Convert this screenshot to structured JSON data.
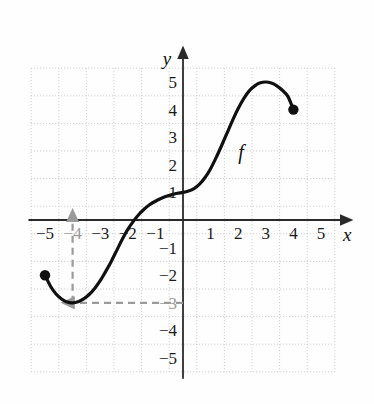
{
  "figure": {
    "background_color": "#fefefe",
    "curve_label": "f",
    "axis_labels": {
      "x": "x",
      "y": "y"
    }
  },
  "colors": {
    "curve": "#101010",
    "axis": "#2a2a2a",
    "grid": "#c9c9c9",
    "tick_text": "#1a1a1a",
    "tick_text_dim": "#9a9a9a",
    "guide": "#9a9a9a",
    "endpoint_dot": "#101010"
  },
  "chart_data": {
    "type": "line",
    "title": "",
    "subtitle": "",
    "xlabel": "x",
    "ylabel": "y",
    "xlim": [
      -5.5,
      5.5
    ],
    "ylim": [
      -5.5,
      5.5
    ],
    "grid": true,
    "grid_style": "dotted",
    "grid_spacing": 1,
    "legend": "none",
    "legend_position": "none",
    "annotations": [
      {
        "name": "curve-label",
        "text": "f",
        "x": 2.1,
        "y": 2.2,
        "style": "italic"
      },
      {
        "name": "vertical-guide-arrow",
        "type": "dashed-arrow",
        "from": [
          -4,
          -3
        ],
        "to": [
          -4,
          0
        ],
        "direction": "up",
        "color": "#9a9a9a"
      },
      {
        "name": "horizontal-guide-arrow",
        "type": "dashed-arrow",
        "from": [
          0,
          -3
        ],
        "to": [
          -4,
          -3
        ],
        "direction": "left",
        "color": "#9a9a9a"
      }
    ],
    "endpoints": [
      {
        "name": "left-endpoint",
        "x": -5,
        "y": -2,
        "marker": "filled-circle"
      },
      {
        "name": "right-endpoint",
        "x": 4,
        "y": 4,
        "marker": "filled-circle"
      }
    ],
    "key_points": [
      {
        "label": "left endpoint",
        "x": -5,
        "y": -2
      },
      {
        "label": "local minimum",
        "x": -4,
        "y": -3
      },
      {
        "label": "x-intercept",
        "x": -2.3,
        "y": 0
      },
      {
        "label": "inflection / plateau",
        "x": 0,
        "y": 1
      },
      {
        "label": "local maximum",
        "x": 3,
        "y": 5
      },
      {
        "label": "right endpoint",
        "x": 4,
        "y": 4
      }
    ],
    "series": [
      {
        "name": "f",
        "x": [
          -5.0,
          -4.8,
          -4.6,
          -4.4,
          -4.2,
          -4.0,
          -3.8,
          -3.6,
          -3.4,
          -3.2,
          -3.0,
          -2.8,
          -2.6,
          -2.4,
          -2.2,
          -2.0,
          -1.8,
          -1.6,
          -1.4,
          -1.2,
          -1.0,
          -0.8,
          -0.6,
          -0.4,
          -0.2,
          0.0,
          0.2,
          0.4,
          0.6,
          0.8,
          1.0,
          1.2,
          1.4,
          1.6,
          1.8,
          2.0,
          2.2,
          2.4,
          2.6,
          2.8,
          3.0,
          3.2,
          3.4,
          3.6,
          3.8,
          4.0
        ],
        "y": [
          -2.0,
          -2.4,
          -2.68,
          -2.86,
          -2.97,
          -3.0,
          -2.96,
          -2.86,
          -2.7,
          -2.48,
          -2.2,
          -1.86,
          -1.5,
          -1.1,
          -0.7,
          -0.34,
          -0.05,
          0.2,
          0.4,
          0.56,
          0.68,
          0.78,
          0.86,
          0.92,
          0.97,
          1.0,
          1.05,
          1.14,
          1.3,
          1.54,
          1.86,
          2.26,
          2.7,
          3.16,
          3.62,
          4.04,
          4.4,
          4.68,
          4.86,
          4.97,
          5.0,
          4.96,
          4.86,
          4.7,
          4.48,
          4.0
        ]
      }
    ],
    "x_ticks": [
      {
        "value": -5,
        "label": "−5",
        "dim": false
      },
      {
        "value": -4,
        "label": "−4",
        "dim": true
      },
      {
        "value": -3,
        "label": "−3",
        "dim": false
      },
      {
        "value": -2,
        "label": "−2",
        "dim": false
      },
      {
        "value": -1,
        "label": "−1",
        "dim": false
      },
      {
        "value": 1,
        "label": "1",
        "dim": false
      },
      {
        "value": 2,
        "label": "2",
        "dim": false
      },
      {
        "value": 3,
        "label": "3",
        "dim": false
      },
      {
        "value": 4,
        "label": "4",
        "dim": false
      },
      {
        "value": 5,
        "label": "5",
        "dim": false
      }
    ],
    "y_ticks": [
      {
        "value": 5,
        "label": "5",
        "dim": false
      },
      {
        "value": 4,
        "label": "4",
        "dim": false
      },
      {
        "value": 3,
        "label": "3",
        "dim": false
      },
      {
        "value": 2,
        "label": "2",
        "dim": false
      },
      {
        "value": 1,
        "label": "1",
        "dim": false
      },
      {
        "value": -1,
        "label": "−1",
        "dim": false
      },
      {
        "value": -2,
        "label": "−2",
        "dim": false
      },
      {
        "value": -3,
        "label": "−3",
        "dim": true
      },
      {
        "value": -4,
        "label": "−4",
        "dim": false
      },
      {
        "value": -5,
        "label": "−5",
        "dim": false
      }
    ]
  }
}
